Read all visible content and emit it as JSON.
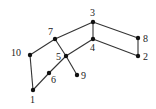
{
  "diagram": {
    "type": "graph",
    "nodes": [
      {
        "id": "1",
        "label": "1",
        "x": 33,
        "y": 90,
        "lx": 30,
        "ly": 103
      },
      {
        "id": "2",
        "label": "2",
        "x": 138,
        "y": 56,
        "lx": 143,
        "ly": 60
      },
      {
        "id": "3",
        "label": "3",
        "x": 93,
        "y": 22,
        "lx": 90,
        "ly": 16
      },
      {
        "id": "4",
        "label": "4",
        "x": 93,
        "y": 39,
        "lx": 90,
        "ly": 51
      },
      {
        "id": "5",
        "label": "5",
        "x": 66,
        "y": 56,
        "lx": 56,
        "ly": 60
      },
      {
        "id": "6",
        "label": "6",
        "x": 49,
        "y": 73,
        "lx": 51,
        "ly": 83
      },
      {
        "id": "7",
        "label": "7",
        "x": 55,
        "y": 39,
        "lx": 48,
        "ly": 35
      },
      {
        "id": "8",
        "label": "8",
        "x": 138,
        "y": 38,
        "lx": 143,
        "ly": 42
      },
      {
        "id": "9",
        "label": "9",
        "x": 77,
        "y": 75,
        "lx": 81,
        "ly": 79
      },
      {
        "id": "10",
        "label": "10",
        "x": 30,
        "y": 55,
        "lx": 11,
        "ly": 56
      }
    ],
    "edges": [
      [
        "1",
        "10"
      ],
      [
        "10",
        "7"
      ],
      [
        "7",
        "3"
      ],
      [
        "3",
        "8"
      ],
      [
        "8",
        "2"
      ],
      [
        "2",
        "4"
      ],
      [
        "4",
        "3"
      ],
      [
        "4",
        "5"
      ],
      [
        "7",
        "5"
      ],
      [
        "5",
        "9"
      ],
      [
        "5",
        "6"
      ],
      [
        "6",
        "1"
      ]
    ]
  }
}
